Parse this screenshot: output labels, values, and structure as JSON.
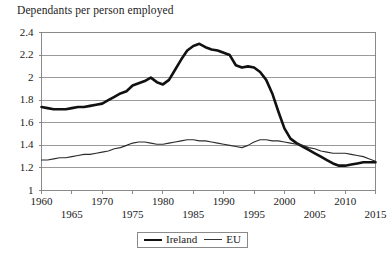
{
  "chart_data": {
    "type": "line",
    "title": "Dependants per person employed",
    "xlabel": "",
    "ylabel": "",
    "xlim": [
      1960,
      2015
    ],
    "ylim": [
      1,
      2.4
    ],
    "grid": true,
    "grid_axis": "y",
    "legend_position": "bottom-center",
    "yticks": [
      1,
      1.2,
      1.4,
      1.6,
      1.8,
      2,
      2.2,
      2.4
    ],
    "ytick_labels": [
      "1",
      "1.2",
      "1.4",
      "1.6",
      "1.8",
      "2",
      "2.2",
      "2.4"
    ],
    "xticks": [
      1960,
      1965,
      1970,
      1975,
      1980,
      1985,
      1990,
      1995,
      2000,
      2005,
      2010,
      2015
    ],
    "xtick_labels": [
      "1960",
      "1965",
      "1970",
      "1975",
      "1980",
      "1985",
      "1990",
      "1995",
      "2000",
      "2005",
      "2010",
      "2015"
    ],
    "xtick_rows": [
      0,
      1,
      0,
      1,
      0,
      1,
      0,
      1,
      0,
      1,
      0,
      1
    ],
    "x": [
      1960,
      1961,
      1962,
      1963,
      1964,
      1965,
      1966,
      1967,
      1968,
      1969,
      1970,
      1971,
      1972,
      1973,
      1974,
      1975,
      1976,
      1977,
      1978,
      1979,
      1980,
      1981,
      1982,
      1983,
      1984,
      1985,
      1986,
      1987,
      1988,
      1989,
      1990,
      1991,
      1992,
      1993,
      1994,
      1995,
      1996,
      1997,
      1998,
      1999,
      2000,
      2001,
      2002,
      2003,
      2004,
      2005,
      2006,
      2007,
      2008,
      2009,
      2010,
      2011,
      2012,
      2013,
      2014,
      2015
    ],
    "series": [
      {
        "name": "Ireland",
        "color": "#111111",
        "width": 2.6,
        "values": [
          1.74,
          1.73,
          1.72,
          1.72,
          1.72,
          1.73,
          1.74,
          1.74,
          1.75,
          1.76,
          1.77,
          1.8,
          1.83,
          1.86,
          1.88,
          1.93,
          1.95,
          1.97,
          2.0,
          1.96,
          1.94,
          1.98,
          2.07,
          2.16,
          2.24,
          2.28,
          2.3,
          2.27,
          2.25,
          2.24,
          2.22,
          2.2,
          2.11,
          2.09,
          2.1,
          2.09,
          2.05,
          1.98,
          1.86,
          1.7,
          1.55,
          1.46,
          1.42,
          1.39,
          1.36,
          1.33,
          1.3,
          1.27,
          1.24,
          1.22,
          1.22,
          1.23,
          1.24,
          1.25,
          1.25,
          1.25
        ]
      },
      {
        "name": "EU",
        "color": "#2b2b2b",
        "width": 1.1,
        "values": [
          1.27,
          1.27,
          1.28,
          1.29,
          1.29,
          1.3,
          1.31,
          1.32,
          1.32,
          1.33,
          1.34,
          1.35,
          1.37,
          1.38,
          1.4,
          1.42,
          1.43,
          1.43,
          1.42,
          1.41,
          1.41,
          1.42,
          1.43,
          1.44,
          1.45,
          1.45,
          1.44,
          1.44,
          1.43,
          1.42,
          1.41,
          1.4,
          1.39,
          1.38,
          1.4,
          1.43,
          1.45,
          1.45,
          1.44,
          1.44,
          1.43,
          1.42,
          1.41,
          1.4,
          1.38,
          1.37,
          1.35,
          1.34,
          1.33,
          1.33,
          1.33,
          1.32,
          1.31,
          1.3,
          1.28,
          1.26
        ]
      }
    ]
  },
  "legend": {
    "items": [
      {
        "label": "Ireland",
        "style": "thick"
      },
      {
        "label": "EU",
        "style": "thin"
      }
    ]
  },
  "axes": {
    "frame_color": "#7d7d7d",
    "grid_color": "#8f8f8f"
  }
}
